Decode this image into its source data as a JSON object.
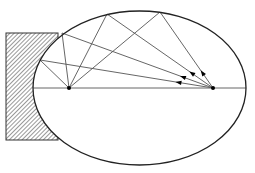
{
  "diagram": {
    "type": "elliptical-mirror-reflection",
    "colors": {
      "background": "#ffffff",
      "ellipse_stroke": "#222222",
      "ray_stroke": "#555555",
      "axis_stroke": "#666666",
      "focus_fill": "#000000",
      "hatch_stroke": "#444444",
      "block_stroke": "#333333"
    },
    "ellipse": {
      "cx": 139.5,
      "cy": 88,
      "rx": 106.5,
      "ry": 77
    },
    "foci": [
      {
        "name": "left-focus",
        "x": 69,
        "y": 88
      },
      {
        "name": "right-focus",
        "x": 213,
        "y": 88
      }
    ],
    "axis": {
      "x1": 33,
      "y1": 88,
      "x2": 246,
      "y2": 88
    },
    "block": {
      "x": 6,
      "y": 33,
      "width": 52,
      "height": 107
    },
    "rays": [
      {
        "from": [
          213,
          88
        ],
        "via": [
          160,
          12
        ],
        "to": [
          69,
          88
        ]
      },
      {
        "from": [
          213,
          88
        ],
        "via": [
          107,
          14
        ],
        "to": [
          69,
          88
        ]
      },
      {
        "from": [
          213,
          88
        ],
        "via": [
          62,
          33
        ],
        "to": [
          69,
          88
        ]
      },
      {
        "from": [
          213,
          88
        ],
        "via": [
          40,
          60
        ],
        "to": [
          69,
          88
        ]
      }
    ]
  }
}
